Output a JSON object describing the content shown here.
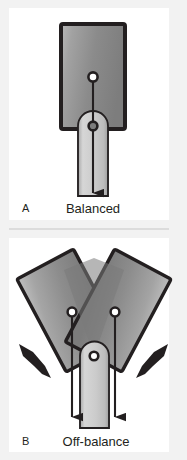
{
  "figure": {
    "background_color": "#f2f2f2",
    "panel_color": "#ffffff",
    "divider_color": "#d9d9d9",
    "ink_color": "#231f20",
    "body_fill_light": "#b4b4b4",
    "body_fill_mid": "#8c8c8c",
    "body_fill_dark": "#6e6e6e",
    "shaft_fill_light": "#d2d2d2",
    "shaft_fill_mid": "#bcbcbc",
    "marker_fill": "#ffffff"
  },
  "panels": [
    {
      "id": "panel-a",
      "letter": "A",
      "caption": "Balanced",
      "description": "Upright block with center of gravity over the base; single vertical weight arrow.",
      "markers": [
        {
          "name": "center-of-gravity-marker",
          "cx": 93,
          "cy": 77
        },
        {
          "name": "pivot-marker",
          "cx": 93,
          "cy": 126
        }
      ],
      "arrows": [
        {
          "name": "weight-arrow",
          "x1": 93,
          "y1": 77,
          "x2": 93,
          "y2": 196
        }
      ]
    },
    {
      "id": "panel-b",
      "letter": "B",
      "caption": "Off-balance",
      "description": "Block tilted into two splayed positions; centers of gravity fall outside the base, with inward push arrows.",
      "markers": [
        {
          "name": "center-of-gravity-marker-left",
          "cx": 72,
          "cy": 312
        },
        {
          "name": "center-of-gravity-marker-right",
          "cx": 115,
          "cy": 312
        },
        {
          "name": "pivot-marker",
          "cx": 94,
          "cy": 356
        }
      ],
      "arrows": [
        {
          "name": "weight-arrow-left",
          "x1": 72,
          "y1": 312,
          "x2": 72,
          "y2": 420
        },
        {
          "name": "weight-arrow-right",
          "x1": 115,
          "y1": 312,
          "x2": 115,
          "y2": 420
        },
        {
          "name": "push-arrow-left",
          "direction": "down-right"
        },
        {
          "name": "push-arrow-right",
          "direction": "down-left"
        }
      ]
    }
  ]
}
